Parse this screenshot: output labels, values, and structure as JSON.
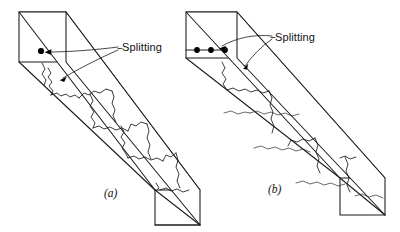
{
  "figure": {
    "background_color": "#ffffff",
    "line_color": "#1a1a1a",
    "annotations": [
      {
        "id": "split_a",
        "text": "Splitting"
      },
      {
        "id": "split_b",
        "text": "Splitting"
      }
    ],
    "captions": [
      {
        "id": "caption_a",
        "text": "(a)"
      },
      {
        "id": "caption_b",
        "text": "(b)"
      }
    ],
    "panels": [
      {
        "id": "panel_a",
        "caption": "(a)",
        "label": "Splitting",
        "load_points": 1,
        "description": "Square prism loaded by a single concentrated point load, showing splitting cracks"
      },
      {
        "id": "panel_b",
        "caption": "(b)",
        "label": "Splitting",
        "load_points": 3,
        "description": "Square prism loaded by a row of three concentrated point loads, showing splitting cracks"
      }
    ]
  }
}
